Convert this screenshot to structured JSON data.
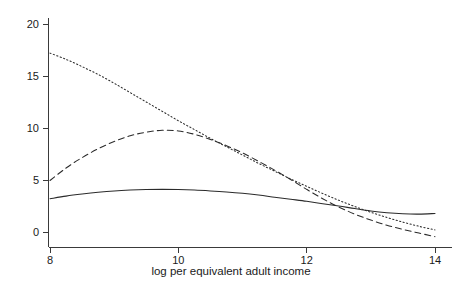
{
  "chart_data": {
    "type": "line",
    "title": "",
    "xlabel": "log per equivalent adult income",
    "ylabel": "",
    "xlim": [
      8,
      14
    ],
    "ylim": [
      -1.2,
      21.2
    ],
    "xticks": [
      8,
      10,
      12,
      14
    ],
    "xtick_labels": [
      "8",
      "10",
      "12",
      "14"
    ],
    "yticks": [
      0,
      5,
      10,
      15,
      20
    ],
    "ytick_labels": [
      "0",
      "5",
      "10",
      "15",
      "20"
    ],
    "grid": false,
    "legend": "none",
    "x": [
      8.0,
      8.25,
      8.5,
      8.75,
      9.0,
      9.25,
      9.5,
      9.75,
      10.0,
      10.25,
      10.5,
      10.75,
      11.0,
      11.25,
      11.5,
      11.75,
      12.0,
      12.25,
      12.5,
      12.75,
      13.0,
      13.25,
      13.5,
      13.75,
      14.0
    ],
    "series": [
      {
        "name": "solid-curve",
        "style": "solid",
        "color": "#2b2b2b",
        "values": [
          3.2,
          3.45,
          3.65,
          3.82,
          3.95,
          4.03,
          4.08,
          4.1,
          4.08,
          4.03,
          3.95,
          3.85,
          3.72,
          3.55,
          3.35,
          3.15,
          2.95,
          2.72,
          2.5,
          2.25,
          2.02,
          1.85,
          1.75,
          1.72,
          1.78
        ]
      },
      {
        "name": "dashed-curve",
        "style": "dashed",
        "color": "#2b2b2b",
        "values": [
          4.95,
          6.15,
          7.15,
          8.0,
          8.7,
          9.25,
          9.6,
          9.78,
          9.72,
          9.4,
          8.9,
          8.3,
          7.6,
          6.8,
          5.95,
          5.05,
          4.1,
          3.2,
          2.4,
          1.72,
          1.15,
          0.65,
          0.25,
          -0.1,
          -0.45
        ]
      },
      {
        "name": "dotted-curve",
        "style": "dotted",
        "color": "#2b2b2b",
        "values": [
          17.2,
          16.6,
          15.9,
          15.15,
          14.3,
          13.4,
          12.5,
          11.6,
          10.7,
          9.85,
          9.0,
          8.2,
          7.4,
          6.6,
          5.85,
          5.1,
          4.4,
          3.7,
          3.05,
          2.45,
          1.9,
          1.4,
          0.95,
          0.55,
          0.2
        ]
      }
    ]
  }
}
